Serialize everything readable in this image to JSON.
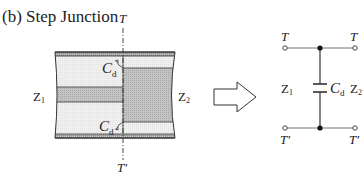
{
  "title": "(b) Step Junction",
  "waveguide": {
    "plane_top_label": "T",
    "plane_bottom_label": "T′",
    "left_impedance": {
      "symbol": "Z",
      "subscript": "1"
    },
    "right_impedance": {
      "symbol": "Z",
      "subscript": "2"
    },
    "cap_top": {
      "symbol": "C",
      "subscript": "d"
    },
    "cap_bottom": {
      "symbol": "C",
      "subscript": "d"
    }
  },
  "arrow": {
    "icon": "hollow-right-arrow-icon"
  },
  "circuit": {
    "top_left_label": "T",
    "top_right_label": "T",
    "bottom_left_label": "T′",
    "bottom_right_label": "T′",
    "left_impedance": {
      "symbol": "Z",
      "subscript": "1"
    },
    "right_impedance": {
      "symbol": "Z",
      "subscript": "2"
    },
    "capacitor": {
      "symbol": "C",
      "subscript": "d"
    }
  },
  "colors": {
    "line": "#333333",
    "light_fill": "#eeeeee",
    "dark_fill": "#bdbdbd",
    "metal_fill": "#9a9a9a",
    "wire": "#777777"
  }
}
